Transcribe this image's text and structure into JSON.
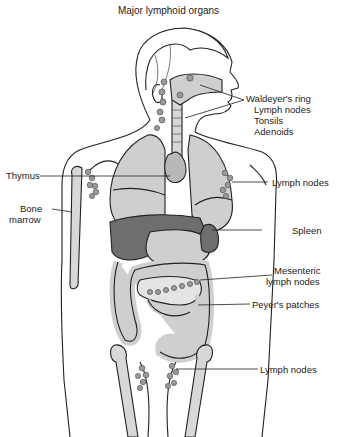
{
  "title": "Major lymphoid organs",
  "labels": {
    "waldeyer": "Waldeyer's ring",
    "waldeyer_items": [
      "Lymph nodes",
      "Tonsils",
      "Adenoids"
    ],
    "thymus": "Thymus",
    "bone_marrow_1": "Bone",
    "bone_marrow_2": "marrow",
    "lymph_nodes_axillary": "Lymph nodes",
    "spleen": "Spleen",
    "mesenteric_1": "Mesenteric",
    "mesenteric_2": "lymph nodes",
    "peyers": "Peyer's patches",
    "lymph_nodes_inguinal": "Lymph nodes"
  },
  "colors": {
    "outline": "#222222",
    "organ_fill": "#cfcfcf",
    "dark_organ": "#6e6e6e",
    "node_fill": "#9a9a9a",
    "bone_fill": "#d8d8d8",
    "background": "#ffffff"
  }
}
